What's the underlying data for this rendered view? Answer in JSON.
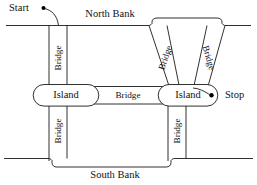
{
  "diagram": {
    "colors": {
      "stroke": "#1a1a1a",
      "fill": "#ffffff",
      "text": "#111111",
      "dot": "#000000"
    },
    "banks": [
      {
        "id": "north-bank",
        "label": "North Bank"
      },
      {
        "id": "south-bank",
        "label": "South Bank"
      }
    ],
    "islands": [
      {
        "id": "island-left",
        "label": "Island"
      },
      {
        "id": "island-right",
        "label": "Island"
      }
    ],
    "bridges": [
      {
        "id": "bridge-nw",
        "label": "Bridge",
        "orientation": "vertical"
      },
      {
        "id": "bridge-ne-left",
        "label": "Bridge",
        "orientation": "diagonal-left"
      },
      {
        "id": "bridge-ne-right",
        "label": "Bridge",
        "orientation": "diagonal-right"
      },
      {
        "id": "bridge-middle",
        "label": "Bridge",
        "orientation": "horizontal"
      },
      {
        "id": "bridge-sw",
        "label": "Bridge",
        "orientation": "vertical"
      },
      {
        "id": "bridge-se",
        "label": "Bridge",
        "orientation": "vertical"
      }
    ],
    "endpoints": [
      {
        "id": "start",
        "label": "Start"
      },
      {
        "id": "stop",
        "label": "Stop"
      }
    ]
  }
}
